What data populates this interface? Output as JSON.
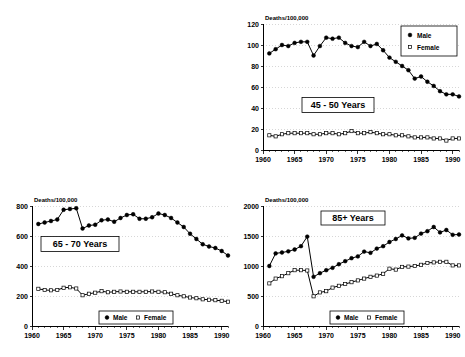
{
  "figure": {
    "layout": "2x2 grid, top-left quadrant empty",
    "background": "#ffffff",
    "ink_color": "#000000",
    "gridline_color": "#bdbdbd"
  },
  "panels": [
    {
      "id": "panel-45",
      "title": "45 - 50 Years",
      "legend_orientation": "vertical",
      "legend_position": "top-right"
    },
    {
      "id": "panel-65",
      "title": "65 - 70 Years",
      "legend_orientation": "horizontal",
      "legend_position": "bottom-center"
    },
    {
      "id": "panel-85",
      "title": "85+ Years",
      "legend_orientation": "horizontal",
      "legend_position": "bottom-center"
    }
  ],
  "legend": {
    "male_label": "Male",
    "female_label": "Female",
    "male_marker": "filled-diamond",
    "female_marker": "open-square"
  },
  "chart_data": [
    {
      "type": "line",
      "panel_id": "panel-45",
      "title": "45 - 50 Years",
      "xlabel": "",
      "ylabel": "Deaths/100,000",
      "xlim": [
        1960,
        1991
      ],
      "ylim": [
        0,
        120
      ],
      "yticks": [
        0,
        20,
        40,
        60,
        80,
        100,
        120
      ],
      "xticks": [
        1960,
        1965,
        1970,
        1975,
        1980,
        1985,
        1990
      ],
      "grid": true,
      "legend_position": "top-right",
      "x": [
        1961,
        1962,
        1963,
        1964,
        1965,
        1966,
        1967,
        1968,
        1969,
        1970,
        1971,
        1972,
        1973,
        1974,
        1975,
        1976,
        1977,
        1978,
        1979,
        1980,
        1981,
        1982,
        1983,
        1984,
        1985,
        1986,
        1987,
        1988,
        1989,
        1990,
        1991
      ],
      "series": [
        {
          "name": "Male",
          "marker": "filled-diamond",
          "values": [
            92,
            96,
            100,
            99,
            102,
            103,
            103,
            90,
            99,
            107,
            106,
            107,
            102,
            99,
            98,
            103,
            99,
            101,
            95,
            88,
            84,
            80,
            76,
            68,
            70,
            65,
            61,
            56,
            53,
            53,
            51
          ]
        },
        {
          "name": "Female",
          "marker": "open-square",
          "values": [
            14,
            13,
            15,
            16,
            16,
            16,
            16,
            15,
            15,
            16,
            16,
            15,
            16,
            18,
            16,
            16,
            17,
            16,
            15,
            15,
            14,
            14,
            13,
            12,
            12,
            12,
            11,
            11,
            9,
            11,
            11
          ]
        }
      ]
    },
    {
      "type": "line",
      "panel_id": "panel-65",
      "title": "65 - 70 Years",
      "xlabel": "",
      "ylabel": "Deaths/100,000",
      "xlim": [
        1960,
        1991
      ],
      "ylim": [
        0,
        800
      ],
      "yticks": [
        0,
        200,
        400,
        600,
        800
      ],
      "xticks": [
        1960,
        1965,
        1970,
        1975,
        1980,
        1985,
        1990
      ],
      "grid": true,
      "legend_position": "bottom-center",
      "x": [
        1961,
        1962,
        1963,
        1964,
        1965,
        1966,
        1967,
        1968,
        1969,
        1970,
        1971,
        1972,
        1973,
        1974,
        1975,
        1976,
        1977,
        1978,
        1979,
        1980,
        1981,
        1982,
        1983,
        1984,
        1985,
        1986,
        1987,
        1988,
        1989,
        1990,
        1991
      ],
      "series": [
        {
          "name": "Male",
          "marker": "filled-circle",
          "values": [
            680,
            690,
            700,
            710,
            775,
            780,
            785,
            650,
            670,
            675,
            705,
            710,
            695,
            720,
            740,
            745,
            715,
            715,
            725,
            750,
            740,
            720,
            690,
            660,
            615,
            580,
            545,
            530,
            520,
            500,
            470
          ]
        },
        {
          "name": "Female",
          "marker": "open-square",
          "values": [
            248,
            240,
            238,
            240,
            255,
            258,
            250,
            205,
            215,
            222,
            232,
            225,
            228,
            230,
            228,
            228,
            228,
            228,
            230,
            228,
            225,
            215,
            205,
            198,
            190,
            185,
            178,
            175,
            172,
            168,
            162
          ]
        }
      ]
    },
    {
      "type": "line",
      "panel_id": "panel-85",
      "title": "85+ Years",
      "xlabel": "",
      "ylabel": "Deaths/100,000",
      "xlim": [
        1960,
        1991
      ],
      "ylim": [
        0,
        2000
      ],
      "yticks": [
        0,
        500,
        1000,
        1500,
        2000
      ],
      "xticks": [
        1960,
        1965,
        1970,
        1975,
        1980,
        1985,
        1990
      ],
      "grid": true,
      "legend_position": "bottom-center",
      "x": [
        1961,
        1962,
        1963,
        1964,
        1965,
        1966,
        1967,
        1968,
        1969,
        1970,
        1971,
        1972,
        1973,
        1974,
        1975,
        1976,
        1977,
        1978,
        1979,
        1980,
        1981,
        1982,
        1983,
        1984,
        1985,
        1986,
        1987,
        1988,
        1989,
        1990,
        1991
      ],
      "series": [
        {
          "name": "Male",
          "marker": "filled-circle",
          "values": [
            1000,
            1210,
            1225,
            1245,
            1275,
            1330,
            1490,
            820,
            880,
            930,
            970,
            1030,
            1080,
            1130,
            1160,
            1240,
            1220,
            1290,
            1330,
            1400,
            1450,
            1510,
            1460,
            1470,
            1540,
            1580,
            1650,
            1560,
            1600,
            1520,
            1525
          ]
        },
        {
          "name": "Female",
          "marker": "open-square",
          "values": [
            710,
            790,
            830,
            880,
            930,
            930,
            925,
            495,
            560,
            580,
            640,
            670,
            700,
            730,
            760,
            790,
            820,
            840,
            870,
            955,
            940,
            985,
            990,
            1000,
            1020,
            1050,
            1060,
            1070,
            1070,
            1010,
            1010
          ]
        }
      ]
    }
  ]
}
